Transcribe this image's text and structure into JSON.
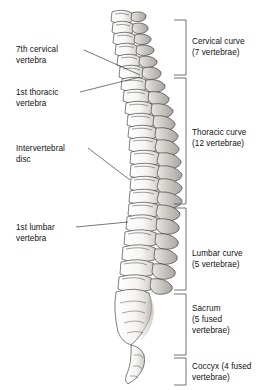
{
  "figure": {
    "orientation": "left lateral, head at top"
  },
  "colors": {
    "ink": "#111111",
    "bracket": "#5a5a5a",
    "leader": "#3c3c3c",
    "bone_fill": "#fbfbfa",
    "bone_shade": "#b9b6b2",
    "bone_dark": "#8d8a86",
    "background": "#ffffff"
  },
  "left_labels": [
    {
      "name": "seventh-cervical-vertebra",
      "lines": "7th cervical\nvertebra",
      "text_x": 16,
      "text_y": 44,
      "leader": {
        "x1": 84,
        "y1": 50,
        "x2": 140,
        "y2": 75
      }
    },
    {
      "name": "first-thoracic-vertebra",
      "lines": "1st thoracic\nvertebra",
      "text_x": 16,
      "text_y": 87,
      "leader": {
        "x1": 80,
        "y1": 92,
        "x2": 140,
        "y2": 77
      }
    },
    {
      "name": "intervertebral-disc",
      "lines": "Intervertebral\ndisc",
      "text_x": 16,
      "text_y": 143,
      "leader": {
        "x1": 88,
        "y1": 148,
        "x2": 130,
        "y2": 180
      }
    },
    {
      "name": "first-lumbar-vertebra",
      "lines": "1st lumbar\nvertebra",
      "text_x": 16,
      "text_y": 222,
      "leader": {
        "x1": 76,
        "y1": 227,
        "x2": 128,
        "y2": 222
      }
    }
  ],
  "regions": [
    {
      "name": "cervical-curve",
      "lines": "Cervical curve\n(7 vertebrae)",
      "text_x": 192,
      "text_y": 36,
      "bracket": {
        "top": 20,
        "bottom": 75
      }
    },
    {
      "name": "thoracic-curve",
      "lines": "Thoracic curve\n(12 vertebrae)",
      "text_x": 192,
      "text_y": 127,
      "bracket": {
        "top": 78,
        "bottom": 204
      }
    },
    {
      "name": "lumbar-curve",
      "lines": "Lumbar curve\n(5 vertebrae)",
      "text_x": 192,
      "text_y": 248,
      "bracket": {
        "top": 208,
        "bottom": 290
      }
    },
    {
      "name": "sacrum",
      "lines": "Sacrum\n(5 fused\nvertebrae)",
      "text_x": 192,
      "text_y": 303,
      "bracket": {
        "top": 294,
        "bottom": 355
      }
    },
    {
      "name": "coccyx",
      "lines": "Coccyx (4 fused\nvertebrae)",
      "text_x": 192,
      "text_y": 361,
      "bracket": {
        "top": 358,
        "bottom": 385
      }
    }
  ]
}
